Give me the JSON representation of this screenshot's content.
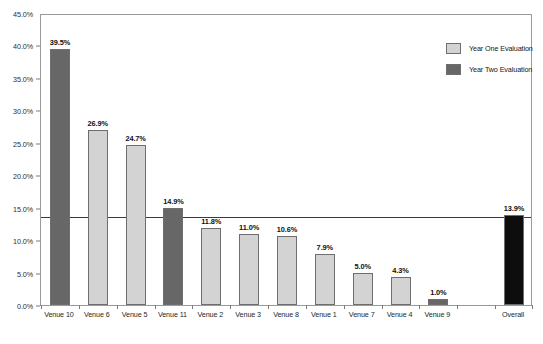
{
  "chart_data": {
    "type": "bar",
    "title": "",
    "subtitle": "",
    "xlabel": "",
    "ylabel": "",
    "ylim": [
      0,
      45
    ],
    "grid": false,
    "legend_position": "top-right",
    "y_ticks": [
      "0.0%",
      "5.0%",
      "10.0%",
      "15.0%",
      "20.0%",
      "25.0%",
      "30.0%",
      "35.0%",
      "40.0%",
      "45.0%"
    ],
    "y_tick_values": [
      0,
      5,
      10,
      15,
      20,
      25,
      30,
      35,
      40,
      45
    ],
    "categories": [
      "Venue 10",
      "Venue 6",
      "Venue 5",
      "Venue 11",
      "Venue 2",
      "Venue 3",
      "Venue 8",
      "Venue 1",
      "Venue 7",
      "Venue 4",
      "Venue 9",
      "",
      "Overall"
    ],
    "values": [
      39.5,
      26.9,
      24.7,
      14.9,
      11.8,
      11.0,
      10.6,
      7.9,
      5.0,
      4.3,
      1.0,
      null,
      13.9
    ],
    "data_labels": [
      "39.5%",
      "26.9%",
      "24.7%",
      "14.9%",
      "11.8%",
      "11.0%",
      "10.6%",
      "7.9%",
      "5.0%",
      "4.3%",
      "1.0%",
      "",
      "13.9%"
    ],
    "series_of_bar": [
      "Year Two Evaluation",
      "Year One Evaluation",
      "Year One Evaluation",
      "Year Two Evaluation",
      "Year One Evaluation",
      "Year One Evaluation",
      "Year One Evaluation",
      "Year One Evaluation",
      "Year One Evaluation",
      "Year One Evaluation",
      "Year Two Evaluation",
      "",
      "Overall"
    ],
    "bar_colors": [
      "#676767",
      "#d3d3d3",
      "#d3d3d3",
      "#676767",
      "#d3d3d3",
      "#d3d3d3",
      "#d3d3d3",
      "#d3d3d3",
      "#d3d3d3",
      "#d3d3d3",
      "#676767",
      "",
      "#0d0d0d"
    ],
    "reference_line": {
      "value": 13.9,
      "label": "",
      "color": "#3a3a3a"
    },
    "legend": [
      {
        "label": "Year One Evaluation",
        "color": "#d3d3d3"
      },
      {
        "label": "Year Two Evaluation",
        "color": "#676767"
      }
    ],
    "colors": {
      "year_one": "#d3d3d3",
      "year_two": "#676767",
      "overall": "#0d0d0d",
      "axis": "#9a9a9a",
      "reference_line": "#3a3a3a",
      "background": "#ffffff"
    }
  }
}
